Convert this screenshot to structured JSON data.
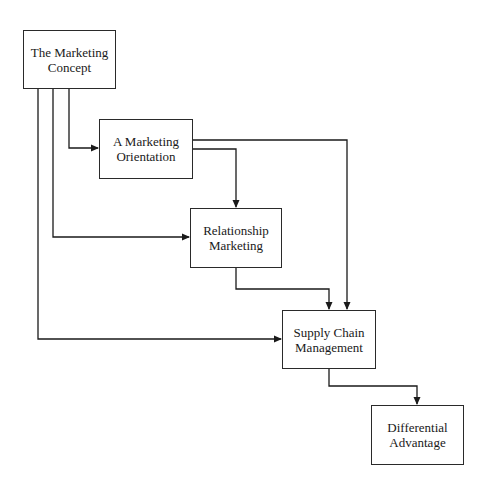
{
  "diagram": {
    "type": "flowchart",
    "nodes": [
      {
        "id": "marketing-concept",
        "label": "The Marketing\nConcept"
      },
      {
        "id": "marketing-orientation",
        "label": "A Marketing\nOrientation"
      },
      {
        "id": "relationship-marketing",
        "label": "Relationship\nMarketing"
      },
      {
        "id": "supply-chain-management",
        "label": "Supply Chain\nManagement"
      },
      {
        "id": "differential-advantage",
        "label": "Differential\nAdvantage"
      }
    ],
    "edges": [
      {
        "from": "marketing-concept",
        "to": "marketing-orientation"
      },
      {
        "from": "marketing-concept",
        "to": "relationship-marketing"
      },
      {
        "from": "marketing-concept",
        "to": "supply-chain-management"
      },
      {
        "from": "marketing-orientation",
        "to": "relationship-marketing"
      },
      {
        "from": "marketing-orientation",
        "to": "supply-chain-management"
      },
      {
        "from": "relationship-marketing",
        "to": "supply-chain-management"
      },
      {
        "from": "supply-chain-management",
        "to": "differential-advantage"
      }
    ]
  }
}
